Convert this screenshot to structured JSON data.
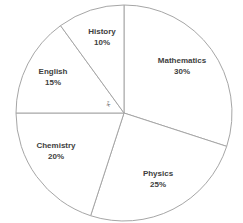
{
  "chart_data": {
    "type": "pie",
    "title": "",
    "categories": [
      "Mathematics",
      "Physics",
      "Chemistry",
      "English",
      "History"
    ],
    "values": [
      30,
      25,
      20,
      15,
      10
    ],
    "labels": [
      "30%",
      "25%",
      "20%",
      "15%",
      "10%"
    ],
    "start_angle_deg": 0,
    "direction": "clockwise",
    "legend": "none",
    "annotation": "x°",
    "colors": {
      "fill": "#ffffff",
      "stroke": "#a6a6a6",
      "text": "#404040"
    }
  },
  "slices": [
    {
      "name": "Mathematics",
      "pct": "30%"
    },
    {
      "name": "Physics",
      "pct": "25%"
    },
    {
      "name": "Chemistry",
      "pct": "20%"
    },
    {
      "name": "English",
      "pct": "15%"
    },
    {
      "name": "History",
      "pct": "10%"
    }
  ]
}
